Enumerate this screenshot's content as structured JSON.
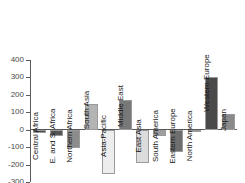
{
  "chart_data": {
    "type": "bar",
    "title": "",
    "subtitle": "",
    "xlabel": "",
    "ylabel": "",
    "ylim": [
      -300,
      400
    ],
    "ytick_labels": [
      "400",
      "300",
      "200",
      "100",
      "0",
      "-100",
      "-200",
      "-300"
    ],
    "yticks": [
      400,
      300,
      200,
      100,
      0,
      -100,
      -200,
      -300
    ],
    "grid": false,
    "legend": false,
    "categories": [
      "Central Africa",
      "E. and S. Africa",
      "Northern Africa",
      "South Asia",
      "Asia-Pacific",
      "Middle East",
      "East Asia",
      "South America",
      "Eastern Europe",
      "North America",
      "Western Europe",
      "Japan"
    ],
    "values": [
      -20,
      -38,
      -103,
      145,
      -255,
      168,
      -192,
      -35,
      -128,
      -3,
      302,
      93
    ],
    "bar_colors": [
      "#4d4d4d",
      "#545454",
      "#8c8c8c",
      "#b4b4b4",
      "#ededed",
      "#787878",
      "#dcdcdc",
      "#9e9e9e",
      "#6e6e6e",
      "#bdbdbd",
      "#4a4a4a",
      "#8a8a8a"
    ],
    "axis_color": "#5a5a5a",
    "tick_label_color": "#4a4a4a",
    "category_label_color": "#1a1a1a",
    "background_color": "#ffffff"
  }
}
